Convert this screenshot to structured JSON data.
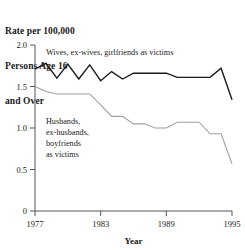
{
  "title": {
    "lines": [
      "Rate per 100,000",
      "Persons Age 16",
      "and Over"
    ]
  },
  "chart_data": {
    "type": "line",
    "title": "Rate per 100,000 Persons Age 16 and Over",
    "xlabel": "Year",
    "ylabel": "",
    "xlim": [
      1977,
      1995
    ],
    "ylim": [
      0,
      2.0
    ],
    "xticks": [
      1977,
      1983,
      1989,
      1995
    ],
    "xticklabels": [
      "1977",
      "1983",
      "1989",
      "1995"
    ],
    "yticks": [
      0,
      0.5,
      1.0,
      1.5,
      2.0
    ],
    "yticklabels": [
      "0",
      "0.5",
      "1.0",
      "1.5",
      "2.0"
    ],
    "grid": false,
    "legend_position": "inline-annotations",
    "x": [
      1977,
      1978,
      1979,
      1980,
      1981,
      1982,
      1983,
      1984,
      1985,
      1986,
      1987,
      1988,
      1989,
      1990,
      1991,
      1992,
      1993,
      1994,
      1995
    ],
    "series": [
      {
        "name": "Wives, ex-wives, girlfriends as victims",
        "color": "#1a1a1a",
        "values": [
          1.71,
          1.78,
          1.6,
          1.77,
          1.59,
          1.76,
          1.57,
          1.68,
          1.59,
          1.66,
          1.66,
          1.66,
          1.66,
          1.61,
          1.61,
          1.61,
          1.61,
          1.72,
          1.34
        ]
      },
      {
        "name": "Husbands, ex-husbands, boyfriends as victims",
        "color": "#a0a0a0",
        "values": [
          1.5,
          1.44,
          1.41,
          1.41,
          1.41,
          1.41,
          1.28,
          1.14,
          1.14,
          1.05,
          1.05,
          1.0,
          1.0,
          1.07,
          1.07,
          1.07,
          0.93,
          0.93,
          0.57
        ]
      }
    ],
    "annotations": [
      {
        "name": "wives-label",
        "text_lines": [
          "Wives, ex-wives, girlfriends as victims"
        ],
        "x": 1978.0,
        "y": 1.88
      },
      {
        "name": "husbands-label",
        "text_lines": [
          "Husbands,",
          "ex-husbands,",
          "boyfriends",
          "as victims"
        ],
        "x": 1978.0,
        "y": 1.05
      }
    ]
  },
  "colors": {
    "axis": "#555555",
    "series_dark": "#1a1a1a",
    "series_light": "#a0a0a0",
    "text": "#1a1a1a",
    "background": "#ffffff"
  }
}
